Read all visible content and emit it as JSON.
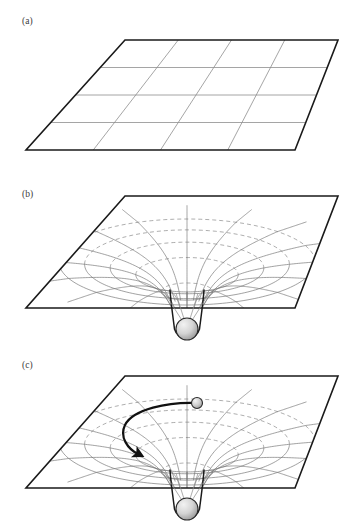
{
  "figure": {
    "title_visible": false,
    "background_color": "#ffffff",
    "width": 358,
    "height": 525
  },
  "panels": [
    {
      "id": "a",
      "label": "(a)",
      "label_pos": {
        "x": 22,
        "y": 24
      },
      "description": "flat undistorted spacetime grid",
      "plane": {
        "corners": {
          "top_left": {
            "x": 125,
            "y": 40
          },
          "top_right": {
            "x": 338,
            "y": 40
          },
          "bottom_right": {
            "x": 295,
            "y": 150
          },
          "bottom_left": {
            "x": 26,
            "y": 150
          }
        },
        "grid_divisions_u": 4,
        "grid_divisions_v": 4,
        "border_color": "#1a1a1a",
        "border_width": 1.6,
        "grid_color": "#8e8e8e",
        "grid_width": 0.8
      },
      "has_well": false,
      "has_mass": false,
      "has_trajectory": false
    },
    {
      "id": "b",
      "label": "(b)",
      "label_pos": {
        "x": 22,
        "y": 197
      },
      "description": "spacetime curved by a central mass forming a funnel",
      "plane": {
        "corners": {
          "top_left": {
            "x": 125,
            "y": 196
          },
          "top_right": {
            "x": 338,
            "y": 196
          },
          "bottom_right": {
            "x": 295,
            "y": 308
          },
          "bottom_left": {
            "x": 26,
            "y": 308
          }
        },
        "border_color": "#1a1a1a",
        "border_width": 1.6,
        "grid_color": "#7a7a7a",
        "grid_width": 0.7,
        "dashed_grid_color": "#8a8a8a",
        "dash_pattern": "4,3"
      },
      "well": {
        "center": {
          "x": 187,
          "y": 262
        },
        "throat": {
          "x": 187,
          "y": 296
        },
        "rings": 5,
        "radial_lines": 16,
        "outer_radius_x": 128,
        "outer_radius_y": 43
      },
      "has_well": true,
      "has_mass": true,
      "mass": {
        "center": {
          "x": 187,
          "y": 329
        },
        "radius": 11,
        "fill": "#d4d4d4",
        "highlight": "#f2f2f2",
        "stroke": "#2a2a2a"
      },
      "has_trajectory": false
    },
    {
      "id": "c",
      "label": "(c)",
      "label_pos": {
        "x": 22,
        "y": 368
      },
      "description": "test particle deflected along a curved trajectory in the warped spacetime",
      "plane": {
        "corners": {
          "top_left": {
            "x": 125,
            "y": 376
          },
          "top_right": {
            "x": 338,
            "y": 376
          },
          "bottom_right": {
            "x": 295,
            "y": 488
          },
          "bottom_left": {
            "x": 26,
            "y": 488
          }
        },
        "border_color": "#1a1a1a",
        "border_width": 1.6,
        "grid_color": "#7a7a7a",
        "grid_width": 0.7,
        "dashed_grid_color": "#8a8a8a",
        "dash_pattern": "4,3"
      },
      "well": {
        "center": {
          "x": 187,
          "y": 442
        },
        "throat": {
          "x": 187,
          "y": 476
        },
        "rings": 5,
        "radial_lines": 16,
        "outer_radius_x": 128,
        "outer_radius_y": 43
      },
      "has_well": true,
      "has_mass": true,
      "mass": {
        "center": {
          "x": 187,
          "y": 509
        },
        "radius": 11,
        "fill": "#d4d4d4",
        "highlight": "#f2f2f2",
        "stroke": "#2a2a2a"
      },
      "has_trajectory": true,
      "trajectory": {
        "start": {
          "x": 196,
          "y": 403
        },
        "end": {
          "x": 140,
          "y": 455
        },
        "stroke": "#111111",
        "width": 2.2,
        "arrowhead": true,
        "path": "M 196 403 C 168 402 133 409 125 425 C 119 437 128 449 138 454"
      },
      "particle": {
        "center": {
          "x": 197,
          "y": 403
        },
        "radius": 5.5,
        "fill": "#cfcfcf",
        "highlight": "#f4f4f4",
        "stroke": "#2a2a2a"
      }
    }
  ],
  "colors": {
    "ink": "#1a1a1a",
    "grid": "#7a7a7a",
    "grid_dashed": "#8a8a8a",
    "mass_fill": "#d4d4d4",
    "background": "#ffffff"
  }
}
